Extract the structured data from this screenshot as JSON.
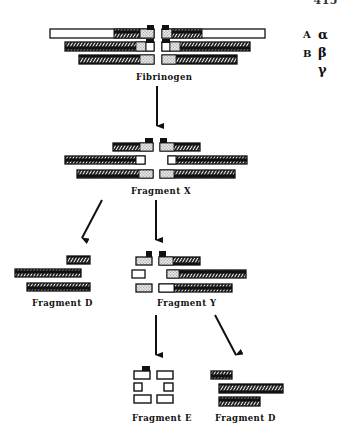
{
  "header": {
    "running_title": "FIBRINOGEN AND FIBRIN DEGRADATION",
    "page_number": "415"
  },
  "legend": {
    "items": [
      {
        "chain_label": "A",
        "greek": "α"
      },
      {
        "chain_label": "B",
        "greek": "β"
      },
      {
        "chain_label": "",
        "greek": "γ"
      }
    ]
  },
  "stages": {
    "fibrinogen": {
      "label": "Fibrinogen"
    },
    "fragment_x": {
      "label": "Fragment X"
    },
    "fragment_d_left": {
      "label": "Fragment D"
    },
    "fragment_y": {
      "label": "Fragment Y"
    },
    "fragment_e": {
      "label": "Fragment E"
    },
    "fragment_d_right": {
      "label": "Fragment D"
    }
  },
  "colors": {
    "ink": "#111111",
    "stipple": "#cfcfcf",
    "open": "#ffffff"
  },
  "arrows": [
    {
      "from": "Fibrinogen",
      "to": "Fragment X"
    },
    {
      "from": "Fragment X",
      "to": "Fragment D"
    },
    {
      "from": "Fragment X",
      "to": "Fragment Y"
    },
    {
      "from": "Fragment Y",
      "to": "Fragment E"
    },
    {
      "from": "Fragment Y",
      "to": "Fragment D"
    }
  ]
}
